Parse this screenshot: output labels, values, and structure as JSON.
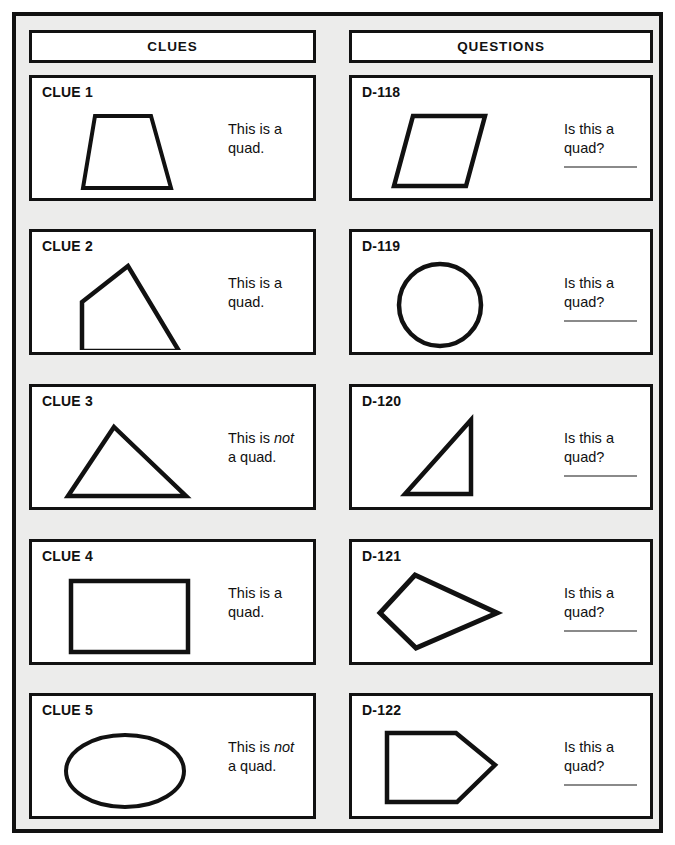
{
  "worksheet": {
    "background_color": "#ececeb",
    "ink_color": "#111111",
    "answer_line_color": "#8a8a8a"
  },
  "columns": {
    "clues_header": "CLUES",
    "questions_header": "QUESTIONS"
  },
  "clues": [
    {
      "title": "CLUE 1",
      "shape": "trapezoid",
      "text_before": "This is a",
      "text_emphasis": "",
      "text_after": "quad.",
      "verdict": "is a quad"
    },
    {
      "title": "CLUE 2",
      "shape": "irregular-quadrilateral",
      "text_before": "This is a",
      "text_emphasis": "",
      "text_after": "quad.",
      "verdict": "is a quad"
    },
    {
      "title": "CLUE 3",
      "shape": "triangle",
      "text_before": "This is ",
      "text_emphasis": "not",
      "text_after": "a quad.",
      "verdict": "is not a quad"
    },
    {
      "title": "CLUE 4",
      "shape": "rectangle",
      "text_before": "This is a",
      "text_emphasis": "",
      "text_after": "quad.",
      "verdict": "is a quad"
    },
    {
      "title": "CLUE 5",
      "shape": "ellipse",
      "text_before": "This is ",
      "text_emphasis": "not",
      "text_after": "a quad.",
      "verdict": "is not a quad"
    }
  ],
  "questions": [
    {
      "title": "D-118",
      "shape": "parallelogram",
      "prompt": "Is this a\nquad?",
      "answer": ""
    },
    {
      "title": "D-119",
      "shape": "circle",
      "prompt": "Is this a\nquad?",
      "answer": ""
    },
    {
      "title": "D-120",
      "shape": "right-triangle",
      "prompt": "Is this a\nquad?",
      "answer": ""
    },
    {
      "title": "D-121",
      "shape": "kite",
      "prompt": "Is this a\nquad?",
      "answer": ""
    },
    {
      "title": "D-122",
      "shape": "pentagon-arrow",
      "prompt": "Is this a\nquad?",
      "answer": ""
    }
  ]
}
